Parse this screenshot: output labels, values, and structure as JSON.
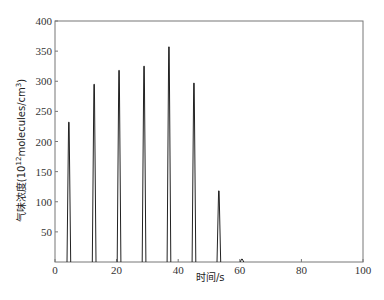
{
  "chart_data": {
    "type": "line",
    "title": "",
    "xlabel": "时间/s",
    "ylabel_main": "气味浓度(10",
    "ylabel_sup1": "12",
    "ylabel_mid": "molecules/cm",
    "ylabel_sup2": "3",
    "ylabel_end": ")",
    "ylabel": "气味浓度(10^12 molecules/cm^3)",
    "xlim": [
      0,
      100
    ],
    "ylim": [
      0,
      400
    ],
    "x_ticks": [
      0,
      20,
      40,
      60,
      80,
      100
    ],
    "y_ticks": [
      50,
      100,
      150,
      200,
      250,
      300,
      350,
      400
    ],
    "x_tick_labels": [
      "0",
      "20",
      "40",
      "60",
      "80",
      "100"
    ],
    "y_tick_labels": [
      "50",
      "100",
      "150",
      "200",
      "250",
      "300",
      "350",
      "400"
    ],
    "grid": false,
    "legend": null,
    "series": [
      {
        "name": "odor concentration",
        "color": "#222222",
        "peaks": [
          {
            "x": 4.5,
            "y": 232
          },
          {
            "x": 12.7,
            "y": 295
          },
          {
            "x": 20.8,
            "y": 318
          },
          {
            "x": 28.9,
            "y": 325
          },
          {
            "x": 37.0,
            "y": 357
          },
          {
            "x": 45.1,
            "y": 297
          },
          {
            "x": 53.2,
            "y": 118
          },
          {
            "x": 60.7,
            "y": 5
          }
        ],
        "peak_half_width": 0.6
      }
    ]
  },
  "layout": {
    "plot_left": 55,
    "plot_right": 363,
    "plot_top": 21,
    "plot_bottom": 262
  }
}
